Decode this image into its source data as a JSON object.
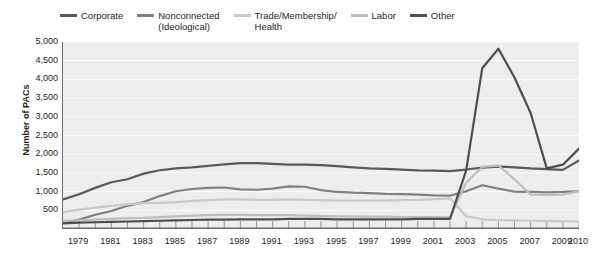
{
  "chart_data": {
    "type": "line",
    "title": "",
    "xlabel": "",
    "ylabel": "Number of PACs",
    "xlim": [
      1978,
      2010
    ],
    "ylim": [
      0,
      5000
    ],
    "ytick_values": [
      500,
      1000,
      1500,
      2000,
      2500,
      3000,
      3500,
      4000,
      4500,
      5000
    ],
    "ytick_labels": [
      "500",
      "1,000",
      "1,500",
      "2,000",
      "2,500",
      "3,000",
      "3,500",
      "4,000",
      "4,500",
      "5,000"
    ],
    "x": [
      1978,
      1979,
      1980,
      1981,
      1982,
      1983,
      1984,
      1985,
      1986,
      1987,
      1988,
      1989,
      1990,
      1991,
      1992,
      1993,
      1994,
      1995,
      1996,
      1997,
      1998,
      1999,
      2000,
      2001,
      2002,
      2003,
      2004,
      2005,
      2006,
      2007,
      2008,
      2009,
      2010
    ],
    "xtick_values": [
      1979,
      1981,
      1983,
      1985,
      1987,
      1989,
      1991,
      1993,
      1995,
      1997,
      1999,
      2001,
      2003,
      2005,
      2007,
      2009,
      2010
    ],
    "xtick_labels": [
      "1979",
      "1981",
      "1983",
      "1985",
      "1987",
      "1989",
      "1991",
      "1993",
      "1995",
      "1997",
      "1999",
      "2001",
      "2003",
      "2005",
      "2007",
      "2009",
      "2010"
    ],
    "grid": true,
    "legend_position": "top",
    "series": [
      {
        "name": "Corporate",
        "color": "#595a5c",
        "values": [
          790,
          930,
          1100,
          1250,
          1330,
          1480,
          1570,
          1620,
          1650,
          1690,
          1730,
          1760,
          1760,
          1740,
          1720,
          1720,
          1710,
          1680,
          1650,
          1620,
          1610,
          1590,
          1570,
          1560,
          1550,
          1590,
          1640,
          1670,
          1650,
          1620,
          1600,
          1580,
          1830
        ]
      },
      {
        "name": "Nonconnected (Ideological)",
        "color": "#808184",
        "values": [
          160,
          250,
          380,
          480,
          620,
          720,
          880,
          1010,
          1070,
          1100,
          1110,
          1060,
          1050,
          1080,
          1140,
          1130,
          1040,
          990,
          970,
          960,
          940,
          930,
          920,
          900,
          890,
          1010,
          1170,
          1080,
          1000,
          990,
          980,
          990,
          1010
        ]
      },
      {
        "name": "Trade/Membership/Health",
        "color": "#c7c8ca",
        "values": [
          450,
          520,
          570,
          620,
          660,
          690,
          700,
          720,
          750,
          770,
          790,
          790,
          780,
          780,
          790,
          780,
          770,
          760,
          760,
          760,
          760,
          770,
          780,
          800,
          820,
          340,
          260,
          240,
          230,
          220,
          210,
          210,
          200
        ]
      },
      {
        "name": "Labor",
        "color": "#bcbec0",
        "values": [
          220,
          230,
          250,
          270,
          290,
          300,
          320,
          340,
          360,
          370,
          380,
          380,
          370,
          370,
          370,
          360,
          350,
          340,
          340,
          330,
          330,
          320,
          320,
          320,
          310,
          1240,
          1660,
          1700,
          1330,
          920,
          910,
          920,
          1010
        ]
      },
      {
        "name": "Other",
        "color": "#4d4e50",
        "values": [
          150,
          170,
          180,
          190,
          200,
          210,
          220,
          230,
          240,
          250,
          250,
          260,
          260,
          260,
          270,
          270,
          270,
          260,
          260,
          260,
          260,
          260,
          270,
          270,
          270,
          1560,
          4300,
          4820,
          4050,
          3100,
          1620,
          1720,
          2150
        ]
      }
    ],
    "legend": [
      {
        "label": "Corporate",
        "color": "#595a5c"
      },
      {
        "label": "Nonconnected\n(Ideological)",
        "color": "#808184"
      },
      {
        "label": "Trade/Membership/\nHealth",
        "color": "#c7c8ca"
      },
      {
        "label": "Labor",
        "color": "#bcbec0"
      },
      {
        "label": "Other",
        "color": "#4d4e50"
      }
    ]
  }
}
